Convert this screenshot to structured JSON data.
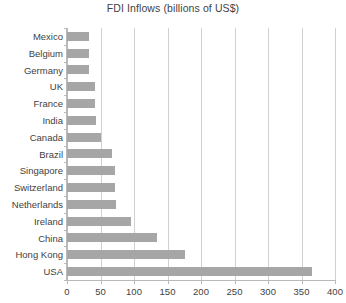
{
  "chart_data": {
    "type": "bar",
    "orientation": "horizontal",
    "title": "FDI Inflows (billions of US$)",
    "xlabel": "",
    "ylabel": "",
    "categories": [
      "Mexico",
      "Belgium",
      "Germany",
      "UK",
      "France",
      "India",
      "Canada",
      "Brazil",
      "Singapore",
      "Switzerland",
      "Netherlands",
      "Ireland",
      "China",
      "Hong Kong",
      "USA"
    ],
    "values": [
      33,
      33,
      33,
      42,
      42,
      44,
      51,
      67,
      72,
      72,
      73,
      96,
      134,
      176,
      366
    ],
    "xlim": [
      0,
      400
    ],
    "xticks": [
      0,
      50,
      100,
      150,
      200,
      250,
      300,
      350,
      400
    ],
    "xtick_labels": [
      "0",
      "50",
      "100",
      "150",
      "200",
      "250",
      "300",
      "350",
      "400"
    ],
    "grid": "vertical",
    "legend": null,
    "bar_color": "#a6a6a6",
    "gridline_color": "#d0d0d0",
    "axis_color": "#b9b9b9",
    "text_color": "#3f3f3f",
    "background": "#ffffff"
  }
}
